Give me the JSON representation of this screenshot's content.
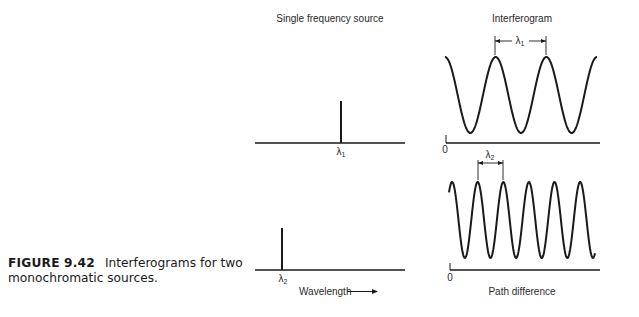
{
  "caption": {
    "figure_number": "FIGURE 9.42",
    "text": "Interferograms for two monochromatic sources."
  },
  "panels": {
    "source_title": "Single frequency source",
    "interferogram_title": "Interferogram",
    "source_xlabel": "Wavelength",
    "interferogram_xlabel": "Path difference",
    "origin_label": "0"
  },
  "sources": [
    {
      "name": "source-1",
      "label": "λ",
      "subscript": "1",
      "relative_position": 0.57
    },
    {
      "name": "source-2",
      "label": "λ",
      "subscript": "2",
      "relative_position": 0.18
    }
  ],
  "interferograms": [
    {
      "name": "interferogram-1",
      "period_label": "λ",
      "period_subscript": "1",
      "cycles": 3.0,
      "start_phase_cycles": 0.0
    },
    {
      "name": "interferogram-2",
      "period_label": "λ",
      "period_subscript": "2",
      "cycles": 5.7,
      "start_phase_cycles": -0.12
    }
  ],
  "colors": {
    "ink": "#1a1a1a",
    "background": "#ffffff"
  }
}
